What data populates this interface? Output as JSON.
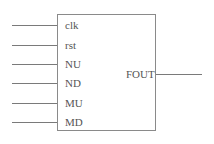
{
  "block": {
    "inputs": [
      {
        "label": "clk",
        "y": 25
      },
      {
        "label": "rst",
        "y": 45
      },
      {
        "label": "NU",
        "y": 64
      },
      {
        "label": "ND",
        "y": 83
      },
      {
        "label": "MU",
        "y": 103
      },
      {
        "label": "MD",
        "y": 122
      }
    ],
    "outputs": [
      {
        "label": "FOUT",
        "y": 74
      }
    ]
  }
}
